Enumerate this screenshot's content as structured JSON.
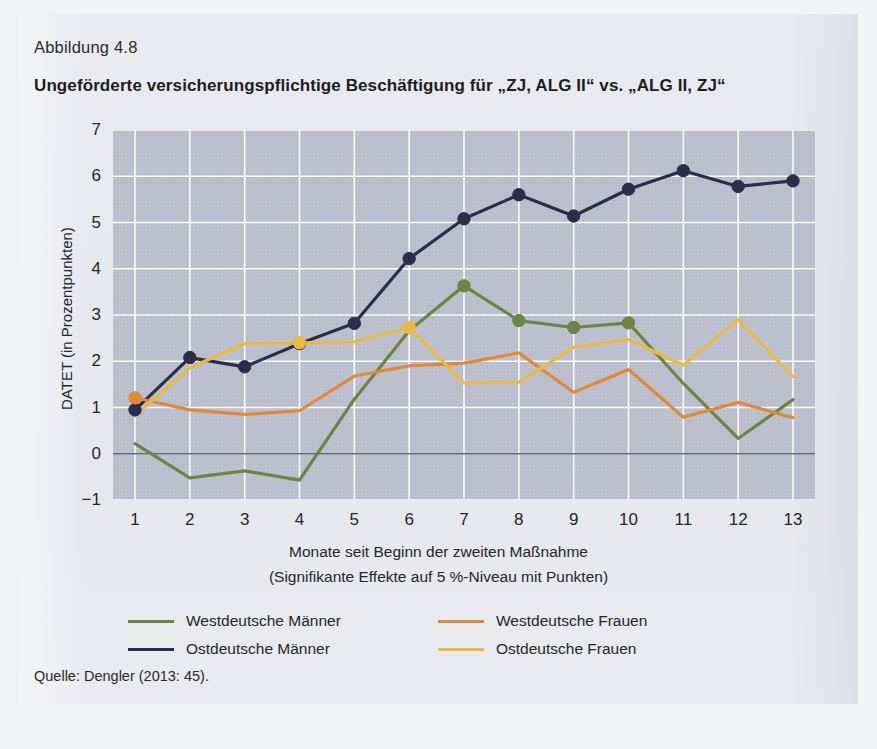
{
  "figure": {
    "label": "Abbildung 4.8",
    "title": "Ungeförderte versicherungspflichtige Beschäftigung für „ZJ, ALG II“ vs. „ALG II, ZJ“",
    "source": "Quelle: Dengler (2013: 45)."
  },
  "chart_data": {
    "type": "line",
    "title": "Ungeförderte versicherungspflichtige Beschäftigung für „ZJ, ALG II“ vs. „ALG II, ZJ“",
    "xlabel": "Monate seit Beginn der zweiten Maßnahme",
    "xlabel_line2": "(Signifikante Effekte auf 5 %-Niveau mit Punkten)",
    "ylabel": "DATET (in Prozentpunkten)",
    "x": [
      1,
      2,
      3,
      4,
      5,
      6,
      7,
      8,
      9,
      10,
      11,
      12,
      13
    ],
    "xticklabels": [
      "1",
      "2",
      "3",
      "4",
      "5",
      "6",
      "7",
      "8",
      "9",
      "10",
      "11",
      "12",
      "13"
    ],
    "yticklabels": [
      "7",
      "6",
      "5",
      "4",
      "3",
      "2",
      "1",
      "0",
      "-1"
    ],
    "ylim": [
      -1,
      7
    ],
    "xlim": [
      1,
      13
    ],
    "grid": true,
    "legend_position": "below",
    "plot_background": "#b9bdcb",
    "gridline_color": "#ffffff",
    "zero_line_color": "#4b4f69",
    "series": [
      {
        "name": "Westdeutsche Männer",
        "color": "#6f8444",
        "values": [
          0.22,
          -0.52,
          -0.37,
          -0.57,
          1.18,
          2.66,
          3.63,
          2.88,
          2.73,
          2.83,
          1.52,
          0.33,
          1.17
        ],
        "significant_points": [
          7,
          8,
          9,
          10
        ]
      },
      {
        "name": "Ostdeutsche Männer",
        "color": "#2b2d4a",
        "values": [
          0.95,
          2.08,
          1.88,
          2.38,
          2.82,
          4.22,
          5.08,
          5.6,
          5.14,
          5.72,
          6.12,
          5.78,
          5.9
        ],
        "significant_points": [
          1,
          2,
          3,
          4,
          5,
          6,
          7,
          8,
          9,
          10,
          11,
          12,
          13
        ]
      },
      {
        "name": "Westdeutsche Frauen",
        "color": "#e0893a",
        "values": [
          1.21,
          0.95,
          0.85,
          0.93,
          1.68,
          1.9,
          1.96,
          2.18,
          1.33,
          1.82,
          0.79,
          1.11,
          0.78
        ],
        "significant_points": [
          1
        ]
      },
      {
        "name": "Ostdeutsche Frauen",
        "color": "#e9b948",
        "values": [
          0.82,
          1.86,
          2.38,
          2.4,
          2.42,
          2.73,
          1.53,
          1.55,
          2.3,
          2.47,
          1.92,
          2.9,
          1.67
        ],
        "significant_points": [
          4,
          6
        ]
      }
    ]
  },
  "legend": [
    {
      "label": "Westdeutsche Männer",
      "color": "#6f8444"
    },
    {
      "label": "Ostdeutsche Männer",
      "color": "#2b2d4a"
    },
    {
      "label": "Westdeutsche Frauen",
      "color": "#e0893a"
    },
    {
      "label": "Ostdeutsche Frauen",
      "color": "#e9b948"
    }
  ]
}
